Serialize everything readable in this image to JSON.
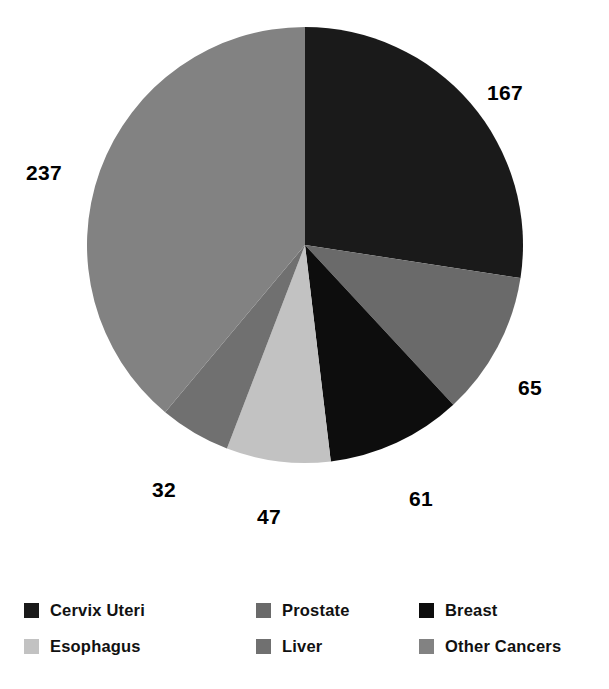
{
  "chart_data": {
    "type": "pie",
    "title": "",
    "subtitle": "",
    "xlabel": "",
    "ylabel": "",
    "legend_position": "bottom",
    "grid": false,
    "total": 609,
    "start_angle_deg": 0,
    "direction": "clockwise",
    "categories": [
      "Cervix Uteri",
      "Prostate",
      "Breast",
      "Esophagus",
      "Liver",
      "Other Cancers"
    ],
    "values": [
      167,
      65,
      61,
      47,
      32,
      237
    ],
    "colors": [
      "#1a1a1a",
      "#6a6a6a",
      "#0d0d0d",
      "#c2c2c2",
      "#707070",
      "#828282"
    ],
    "slices": [
      {
        "label": "Cervix Uteri",
        "value": 167,
        "color": "#1a1a1a",
        "data_label": "167",
        "label_position": "right-top"
      },
      {
        "label": "Prostate",
        "value": 65,
        "color": "#6a6a6a",
        "data_label": "65",
        "label_position": "right-bottom"
      },
      {
        "label": "Breast",
        "value": 61,
        "color": "#0d0d0d",
        "data_label": "61",
        "label_position": "bottom-right"
      },
      {
        "label": "Esophagus",
        "value": 47,
        "color": "#c2c2c2",
        "data_label": "47",
        "label_position": "bottom-center"
      },
      {
        "label": "Liver",
        "value": 32,
        "color": "#707070",
        "data_label": "32",
        "label_position": "bottom-left"
      },
      {
        "label": "Other Cancers",
        "value": 237,
        "color": "#828282",
        "data_label": "237",
        "label_position": "left"
      }
    ]
  },
  "data_labels": {
    "cervix_uteri": "167",
    "prostate": "65",
    "breast": "61",
    "esophagus": "47",
    "liver": "32",
    "other_cancers": "237"
  },
  "legend": {
    "items": [
      {
        "label": "Cervix Uteri",
        "color": "#1a1a1a"
      },
      {
        "label": "Prostate",
        "color": "#6a6a6a"
      },
      {
        "label": "Breast",
        "color": "#0d0d0d"
      },
      {
        "label": "Esophagus",
        "color": "#c2c2c2"
      },
      {
        "label": "Liver",
        "color": "#707070"
      },
      {
        "label": "Other Cancers",
        "color": "#828282"
      }
    ]
  }
}
